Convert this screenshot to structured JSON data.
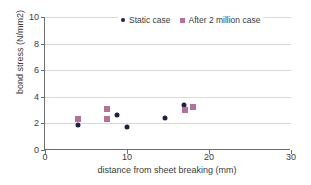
{
  "chart_data": {
    "type": "scatter",
    "title": "",
    "xlabel": "distance from sheet breaking (mm)",
    "ylabel": "bond stress (N/mm2)",
    "xlim": [
      0,
      30
    ],
    "ylim": [
      0,
      10
    ],
    "xticks": [
      0,
      10,
      20,
      30
    ],
    "yticks": [
      0,
      2,
      4,
      6,
      8,
      10
    ],
    "grid": "horizontal",
    "legend_position": "top-right",
    "series": [
      {
        "name": "Static case",
        "marker": "circle",
        "color": "#231f44",
        "points": [
          {
            "x": 4.0,
            "y": 1.85
          },
          {
            "x": 8.8,
            "y": 2.6
          },
          {
            "x": 10.0,
            "y": 1.7
          },
          {
            "x": 14.6,
            "y": 2.4
          },
          {
            "x": 17.0,
            "y": 3.4
          }
        ]
      },
      {
        "name": "After 2 million case",
        "marker": "square",
        "color": "#b2729a",
        "points": [
          {
            "x": 4.0,
            "y": 2.3
          },
          {
            "x": 7.6,
            "y": 3.05
          },
          {
            "x": 7.6,
            "y": 2.3
          },
          {
            "x": 17.1,
            "y": 3.0
          },
          {
            "x": 18.1,
            "y": 3.25
          }
        ]
      }
    ]
  },
  "legend": {
    "entries": [
      {
        "label": "Static case",
        "icon": "circle-marker-icon"
      },
      {
        "label": "After 2 million case",
        "icon": "square-marker-icon"
      }
    ]
  }
}
